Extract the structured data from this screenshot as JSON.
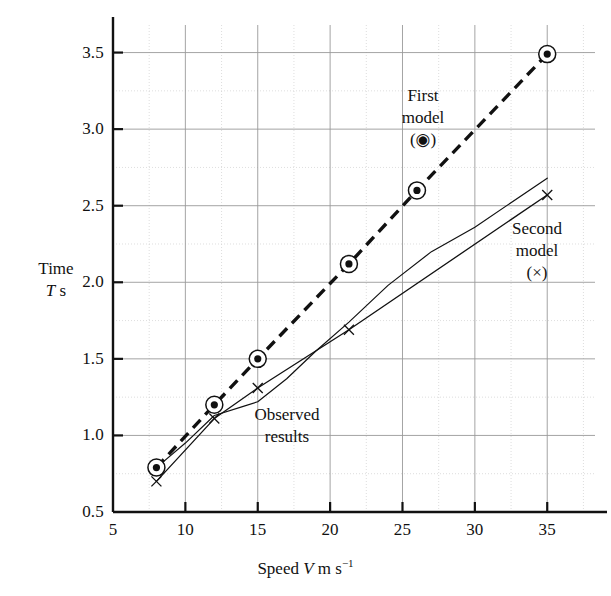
{
  "chart_data": {
    "type": "line",
    "title": "",
    "xlabel": "Speed V m s⁻¹",
    "ylabel": "Time T s",
    "xlim": [
      5,
      38.3
    ],
    "ylim": [
      0.5,
      3.68
    ],
    "grid": true,
    "grid_x_step": 2.5,
    "grid_y_step": 0.25,
    "legend": "inline-annotations",
    "xticks": [
      5,
      10,
      15,
      20,
      25,
      30,
      35
    ],
    "xtick_labels": [
      "5",
      "10",
      "15",
      "20",
      "25",
      "30",
      "35"
    ],
    "yticks": [
      0.5,
      1.0,
      1.5,
      2.0,
      2.5,
      3.0,
      3.5
    ],
    "ytick_labels": [
      "0.5",
      "1.0",
      "1.5",
      "2.0",
      "2.5",
      "3.0",
      "3.5"
    ],
    "series": [
      {
        "name": "First model",
        "marker": "circled-dot",
        "linestyle": "dashed",
        "x": [
          8,
          12,
          15,
          21.3,
          26,
          35
        ],
        "y": [
          0.79,
          1.2,
          1.5,
          2.12,
          2.6,
          3.49
        ]
      },
      {
        "name": "Second model",
        "marker": "cross",
        "linestyle": "solid",
        "x": [
          8,
          12,
          15,
          21.3,
          35
        ],
        "y": [
          0.7,
          1.11,
          1.31,
          1.69,
          2.57
        ]
      },
      {
        "name": "Observed results",
        "marker": "none",
        "linestyle": "solid",
        "x": [
          8,
          10,
          12,
          14,
          15,
          17,
          19,
          21.3,
          24,
          27,
          30,
          35
        ],
        "y": [
          0.79,
          0.95,
          1.13,
          1.19,
          1.22,
          1.37,
          1.55,
          1.74,
          1.98,
          2.2,
          2.36,
          2.68
        ]
      }
    ],
    "annotations": [
      {
        "id": "first-model",
        "text_lines": [
          "First",
          "model",
          "(◉)"
        ],
        "x": 27.5,
        "y": 3.18
      },
      {
        "id": "second-model",
        "text_lines": [
          "Second",
          "model",
          "(×)"
        ],
        "x": 33.0,
        "y": 2.32
      },
      {
        "id": "observed-results",
        "text_lines": [
          "Observed",
          "results"
        ],
        "x": 18.0,
        "y": 1.13
      }
    ]
  },
  "axes": {
    "y_title_line1": "Time",
    "y_title_line2_italic": "T",
    "y_title_line2_rest": " s",
    "x_title_pre": "Speed ",
    "x_title_italic": "V",
    "x_title_post": " m s",
    "x_title_sup": "−1"
  },
  "annotations": {
    "first_model": {
      "l1": "First",
      "l2": "model",
      "l3": "(◉)"
    },
    "second_model": {
      "l1": "Second",
      "l2": "model",
      "l3": "(×)"
    },
    "observed": {
      "l1": "Observed",
      "l2": "results"
    }
  },
  "colors": {
    "axis": "#111111",
    "grid_major": "#9a9a9a",
    "grid_minor": "#cfcfcf",
    "series": "#111111"
  }
}
